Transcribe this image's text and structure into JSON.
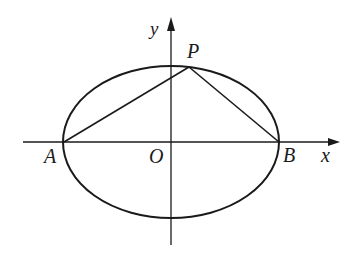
{
  "diagram": {
    "type": "ellipse-with-inscribed-triangle",
    "colors": {
      "stroke": "#1a1a1a",
      "background": "#ffffff"
    },
    "axes": {
      "x_label": "x",
      "y_label": "y",
      "origin_label": "O"
    },
    "ellipse": {
      "cx": 171,
      "cy": 142,
      "rx": 108,
      "ry": 76
    },
    "points": {
      "A": {
        "label": "A",
        "x": 63,
        "y": 142
      },
      "B": {
        "label": "B",
        "x": 279,
        "y": 142
      },
      "P": {
        "label": "P",
        "x": 189,
        "y": 67
      }
    },
    "segments": [
      "AP",
      "PB"
    ]
  }
}
